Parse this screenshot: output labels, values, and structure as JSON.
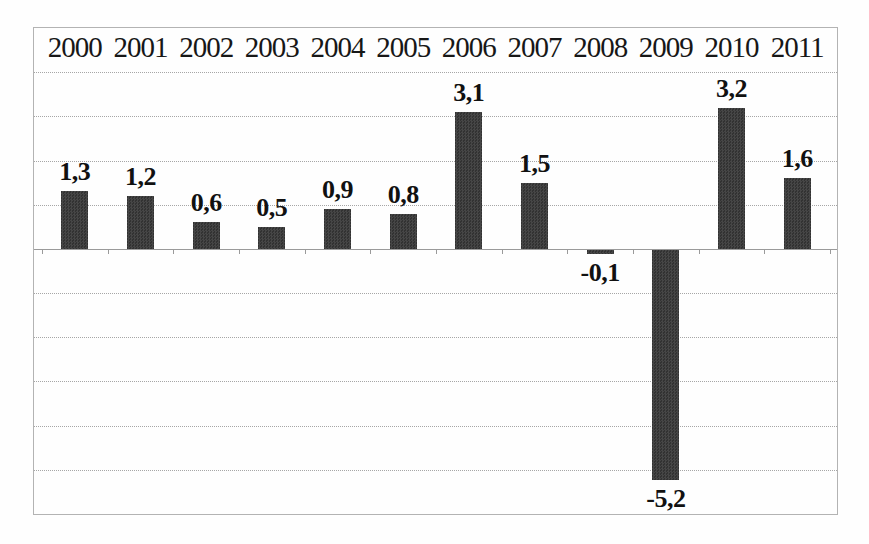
{
  "chart_data": {
    "type": "bar",
    "title": "",
    "xlabel": "",
    "ylabel": "",
    "categories": [
      "2000",
      "2001",
      "2002",
      "2003",
      "2004",
      "2005",
      "2006",
      "2007",
      "2008",
      "2009",
      "2010",
      "2011"
    ],
    "values": [
      1.3,
      1.2,
      0.6,
      0.5,
      0.9,
      0.8,
      3.1,
      1.5,
      -0.1,
      -5.2,
      3.2,
      1.6
    ],
    "value_labels": [
      "1,3",
      "1,2",
      "0,6",
      "0,5",
      "0,9",
      "0,8",
      "3,1",
      "1,5",
      "-0,1",
      "-5,2",
      "3,2",
      "1,6"
    ],
    "decimal_separator": ",",
    "ylim": [
      -6,
      5
    ],
    "gridline_step": 1,
    "grid": "horizontal-dotted",
    "legend": "none",
    "category_labels_position": "top-inside",
    "value_labels_position": "outside-end",
    "colors": {
      "bar": "#3d3d3d",
      "gridline": "#a6a6a6",
      "zero_axis": "#9a9a9a",
      "border": "#b3b3b3",
      "text": "#171717",
      "background": "#fefefe"
    }
  }
}
